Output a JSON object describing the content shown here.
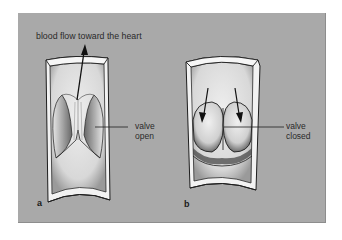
{
  "figure": {
    "panels": [
      {
        "id": "a",
        "letter": "a",
        "state": "valve open",
        "labels": {
          "flow": "blood flow toward the heart",
          "valve_line1": "valve",
          "valve_line2": "open"
        }
      },
      {
        "id": "b",
        "letter": "b",
        "state": "valve closed",
        "labels": {
          "valve_line1": "valve",
          "valve_line2": "closed"
        }
      }
    ],
    "colors": {
      "background": "#a9a9a9",
      "vein_fill": "#e2e2e2",
      "vein_wall": "#f0f0f0",
      "outline": "#1e1e1e"
    }
  }
}
